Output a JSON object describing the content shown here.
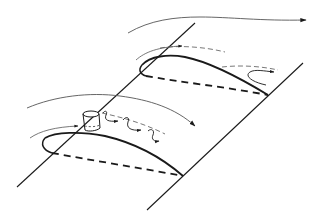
{
  "diagram": {
    "background": "#ffffff",
    "line_color": "#1a1a1a",
    "flow_color": "#555555",
    "elements": {
      "wing_edges": [
        "leading-edge-line",
        "trailing-edge-line"
      ],
      "upper_airfoil": {
        "state": "separated-flow",
        "features": [
          "upper-surface-solid",
          "lower-surface-dashed",
          "separated-recirculation-arrow",
          "boundary-flow-dashed"
        ]
      },
      "lower_airfoil": {
        "state": "attached-flow-with-vortex-generator",
        "features": [
          "upper-surface-solid",
          "lower-surface-dashed",
          "vortex-generator-cylinder",
          "trailing-vortices"
        ]
      },
      "freestream_arrows": [
        "top-freestream-arrow",
        "middle-freestream-arrow"
      ]
    }
  }
}
